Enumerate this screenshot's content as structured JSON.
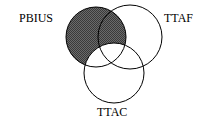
{
  "diagram": {
    "type": "venn",
    "sets": [
      {
        "name": "PBIUS",
        "cx": 96,
        "cy": 37,
        "r": 30
      },
      {
        "name": "TTAF",
        "cx": 130,
        "cy": 37,
        "r": 32
      },
      {
        "name": "TTAC",
        "cx": 114,
        "cy": 73,
        "r": 30
      }
    ],
    "shaded_region": "PBIUS minus TTAC",
    "shade_color": "#555555",
    "labels": {
      "pbius": "PBIUS",
      "ttaf": "TTAF",
      "ttac": "TTAC"
    }
  }
}
